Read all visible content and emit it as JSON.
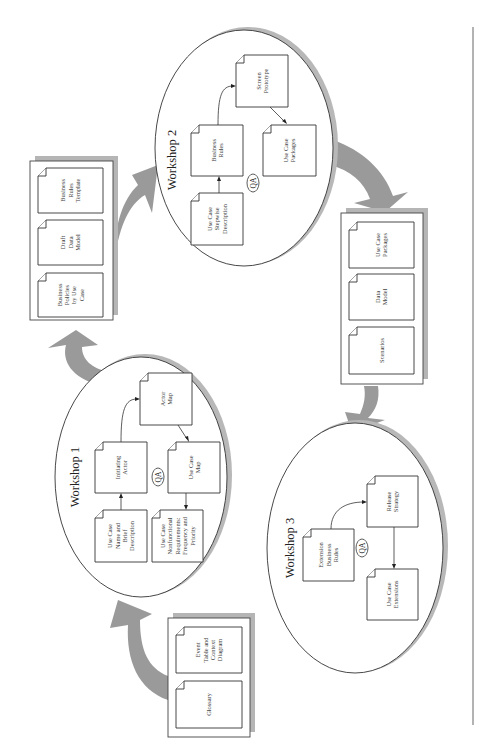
{
  "diagram": {
    "orientation": "rotated-90-ccw",
    "inputs": {
      "docs": [
        {
          "id": "event-table",
          "lines": [
            "Event",
            "Table and",
            "Context",
            "Diagram"
          ]
        },
        {
          "id": "glossary",
          "lines": [
            "Glossary"
          ]
        }
      ]
    },
    "workshop1": {
      "label": "Workshop 1",
      "qa": "QA",
      "docs": [
        {
          "id": "use-case-name",
          "lines": [
            "Use Case",
            "Name and",
            "Brief",
            "Description"
          ]
        },
        {
          "id": "initiating-actor",
          "lines": [
            "Initiating",
            "Actor"
          ]
        },
        {
          "id": "actor-map",
          "lines": [
            "Actor",
            "Map"
          ]
        },
        {
          "id": "use-case-map",
          "lines": [
            "Use Case",
            "Map"
          ]
        },
        {
          "id": "use-case-nonfunctional",
          "lines": [
            "Use Case",
            "Nonfunctional",
            "Requirements:",
            "Frequency and",
            "Priority"
          ]
        }
      ]
    },
    "outputs1": {
      "docs": [
        {
          "id": "business-rules-template",
          "lines": [
            "Business",
            "Rules",
            "Template"
          ]
        },
        {
          "id": "draft-data-model",
          "lines": [
            "Draft",
            "Data",
            "Model"
          ]
        },
        {
          "id": "business-policies",
          "lines": [
            "Business",
            "Policies",
            "by Use",
            "Case"
          ]
        }
      ]
    },
    "workshop2": {
      "label": "Workshop 2",
      "qa": "QA",
      "docs": [
        {
          "id": "screen-prototype",
          "lines": [
            "Screen",
            "Prototype"
          ]
        },
        {
          "id": "business-rules",
          "lines": [
            "Business",
            "Rules"
          ]
        },
        {
          "id": "use-case-packages",
          "lines": [
            "Use Case",
            "Packages"
          ]
        },
        {
          "id": "use-case-stepwise",
          "lines": [
            "Use Case",
            "Stepwise",
            "Description"
          ]
        }
      ]
    },
    "outputs2": {
      "docs": [
        {
          "id": "use-case-packages-out",
          "lines": [
            "Use Case",
            "Packages"
          ]
        },
        {
          "id": "data-model",
          "lines": [
            "Data",
            "Model"
          ]
        },
        {
          "id": "scenarios",
          "lines": [
            "Scenarios"
          ]
        }
      ]
    },
    "workshop3": {
      "label": "Workshop 3",
      "qa": "QA",
      "docs": [
        {
          "id": "extension-business-rules",
          "lines": [
            "Extension",
            "Business",
            "Rules"
          ]
        },
        {
          "id": "release-strategy",
          "lines": [
            "Release",
            "Strategy"
          ]
        },
        {
          "id": "use-case-extensions",
          "lines": [
            "Use Case",
            "Extensions"
          ]
        }
      ]
    },
    "colors": {
      "arrow": "#9a9a9a",
      "shadow": "#b8b8b8",
      "stroke": "#333333"
    }
  }
}
